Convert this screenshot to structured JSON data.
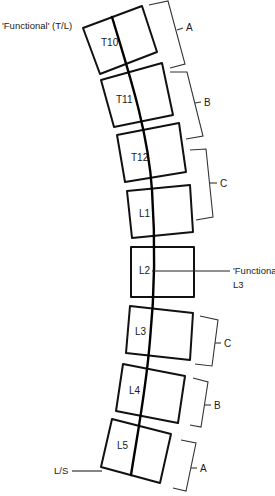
{
  "diagram": {
    "labels": {
      "functional_tl": "'Functional' (T/L)",
      "functional_l3_line1": "'Functional'",
      "functional_l3_line2": "L3",
      "lumbosacral": "L/S"
    },
    "vertebrae": [
      {
        "name": "T10",
        "points": "83,28 142,6 157,52 100,74",
        "label_x": 101,
        "label_y": 46
      },
      {
        "name": "T11",
        "points": "101,80 162,63 173,115 114,127",
        "label_x": 116,
        "label_y": 103
      },
      {
        "name": "T12",
        "points": "117,135 179,123 186,172 125,182",
        "label_x": 131,
        "label_y": 161
      },
      {
        "name": "L1",
        "points": "127,191 190,185 193,232 132,238",
        "label_x": 139,
        "label_y": 217
      },
      {
        "name": "L2",
        "points": "131,247 194,247 194,297 131,297",
        "label_x": 139,
        "label_y": 274
      },
      {
        "name": "L3",
        "points": "130,306 193,313 190,360 126,353",
        "label_x": 135,
        "label_y": 335
      },
      {
        "name": "L4",
        "points": "123,364 185,376 178,423 116,411",
        "label_x": 129,
        "label_y": 394
      },
      {
        "name": "L5",
        "points": "112,419 171,434 160,483 101,467",
        "label_x": 117,
        "label_y": 449
      }
    ],
    "brackets": [
      {
        "label": "A",
        "path": "M149,5 L168,1 L185,64 L170,68",
        "tick": "M177,30 L183,28",
        "label_x": 186,
        "label_y": 31
      },
      {
        "label": "B",
        "path": "M170,72 L187,72 L203,136 L186,139",
        "tick": "M195,103 L201,102",
        "label_x": 204,
        "label_y": 106
      },
      {
        "label": "C",
        "path": "M190,150 L206,149 L213,217 L196,220",
        "tick": "M210,183 L217,183",
        "label_x": 220,
        "label_y": 187
      },
      {
        "label": "C",
        "path": "M200,316 L218,320 L212,366 L195,364",
        "tick": "M215,343 L221,343",
        "label_x": 224,
        "label_y": 347
      },
      {
        "label": "B",
        "path": "M193,378 L208,382 L201,427 L190,425",
        "tick": "M205,405 L211,405",
        "label_x": 214,
        "label_y": 409
      },
      {
        "label": "A",
        "path": "M181,440 L196,443 L186,491 L173,488",
        "tick": "M191,468 L197,468",
        "label_x": 200,
        "label_y": 472
      }
    ],
    "spine_path": "M112,17 C128,70 148,130 152,190 C156,250 154,300 150,340 C146,390 138,430 131,475",
    "colors": {
      "outline": "#111111",
      "bracket": "#333333",
      "background": "#ffffff"
    }
  }
}
